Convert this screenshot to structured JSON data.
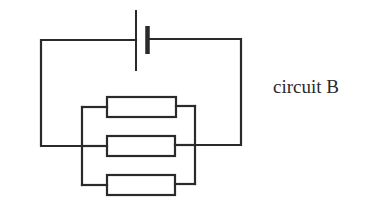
{
  "caption": "circuit B",
  "colors": {
    "stroke": "#2a2a2a",
    "background": "#ffffff"
  },
  "components": {
    "battery": {
      "type": "cell",
      "count": 1
    },
    "resistors": [
      {
        "id": "R1",
        "position": "top branch"
      },
      {
        "id": "R2",
        "position": "middle branch"
      },
      {
        "id": "R3",
        "position": "bottom branch"
      }
    ],
    "arrangement": "three resistors in parallel connected across a single cell"
  }
}
